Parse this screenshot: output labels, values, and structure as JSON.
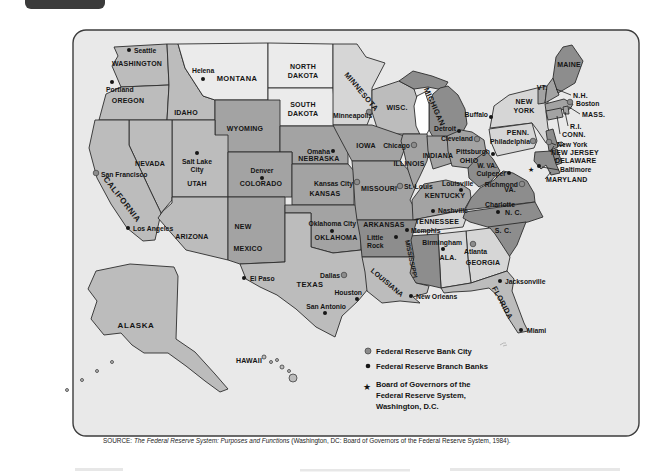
{
  "theme": {
    "panel": "#e9e9e9",
    "panel_border": "#3c3c3c",
    "tab": "#3b3b3b",
    "line": "#2d2d2d",
    "ink": "#141414",
    "lightest": "#ebebeb",
    "light": "#d6d6d6",
    "medium": "#bcbcbc",
    "mediumdark": "#a3a3a3",
    "dark": "#8d8d8d",
    "lake": "#ffffff",
    "dot_bank": "#8c8c8c",
    "dot_branch": "#161616"
  },
  "map": {
    "states": [
      {
        "t": "WASHINGTON"
      },
      {
        "t": "OREGON"
      },
      {
        "t": "IDAHO"
      },
      {
        "t": "MONTANA"
      },
      {
        "t": "NORTH\nDAKOTA"
      },
      {
        "t": "SOUTH\nDAKOTA"
      },
      {
        "t": "WYOMING"
      },
      {
        "t": "NEVADA"
      },
      {
        "t": "UTAH"
      },
      {
        "t": "COLORADO"
      },
      {
        "t": "NEBRASKA"
      },
      {
        "t": "IOWA"
      },
      {
        "t": "KANSAS"
      },
      {
        "t": "MISSOURI"
      },
      {
        "t": "CALIFORNIA"
      },
      {
        "t": "ARIZONA"
      },
      {
        "t": "NEW"
      },
      {
        "t": "MEXICO"
      },
      {
        "t": "OKLAHOMA"
      },
      {
        "t": "ARKANSAS"
      },
      {
        "t": "TEXAS"
      },
      {
        "t": "MINNESOTA"
      },
      {
        "t": "WISC."
      },
      {
        "t": "MICHIGAN"
      },
      {
        "t": "ILLINOIS"
      },
      {
        "t": "INDIANA"
      },
      {
        "t": "OHIO"
      },
      {
        "t": "KENTUCKY"
      },
      {
        "t": "TENNESSEE"
      },
      {
        "t": "MISSISSIPPI"
      },
      {
        "t": "ALA."
      },
      {
        "t": "GEORGIA"
      },
      {
        "t": "LOUISIANA"
      },
      {
        "t": "FLORIDA"
      },
      {
        "t": "NEW\nYORK"
      },
      {
        "t": "PENN."
      },
      {
        "t": "MAINE"
      },
      {
        "t": "VT."
      },
      {
        "t": "W. VA."
      },
      {
        "t": "VA."
      },
      {
        "t": "S. C."
      },
      {
        "t": "N. C."
      },
      {
        "t": "ALASKA"
      },
      {
        "t": "HAWAII"
      }
    ],
    "cities": [
      {
        "n": "Seattle",
        "type": "branch"
      },
      {
        "n": "Portland",
        "type": "branch"
      },
      {
        "n": "Helena",
        "type": "branch"
      },
      {
        "n": "Salt Lake\nCity",
        "type": "branch"
      },
      {
        "n": "San Francisco",
        "type": "bank"
      },
      {
        "n": "Los Angeles",
        "type": "branch"
      },
      {
        "n": "Denver",
        "type": "branch"
      },
      {
        "n": "Omaha",
        "type": "branch"
      },
      {
        "n": "Kansas City",
        "type": "bank"
      },
      {
        "n": "Oklahoma City",
        "type": "branch"
      },
      {
        "n": "Little\nRock",
        "type": "branch"
      },
      {
        "n": "Dallas",
        "type": "bank"
      },
      {
        "n": "El Paso",
        "type": "branch"
      },
      {
        "n": "Houston",
        "type": "branch"
      },
      {
        "n": "San Antonio",
        "type": "branch"
      },
      {
        "n": "New Orleans",
        "type": "branch"
      },
      {
        "n": "Memphis",
        "type": "branch"
      },
      {
        "n": "Nashville",
        "type": "branch"
      },
      {
        "n": "Birmingham",
        "type": "branch"
      },
      {
        "n": "Atlanta",
        "type": "bank"
      },
      {
        "n": "Jacksonville",
        "type": "branch"
      },
      {
        "n": "Miami",
        "type": "branch"
      },
      {
        "n": "Minneapolis",
        "type": "bank"
      },
      {
        "n": "Chicago",
        "type": "bank"
      },
      {
        "n": "St. Louis",
        "type": "bank"
      },
      {
        "n": "Detroit",
        "type": "branch"
      },
      {
        "n": "Cleveland",
        "type": "bank"
      },
      {
        "n": "Buffalo",
        "type": "branch"
      },
      {
        "n": "Pittsburgh",
        "type": "branch"
      },
      {
        "n": "Louisville",
        "type": "branch"
      },
      {
        "n": "Philadelphia",
        "type": "bank"
      },
      {
        "n": "Culpeper",
        "type": "branch"
      },
      {
        "n": "Richmond",
        "type": "bank"
      },
      {
        "n": "Charlotte",
        "type": "branch"
      },
      {
        "n": "Boston",
        "type": "bank"
      },
      {
        "n": "New York",
        "type": "bank"
      },
      {
        "n": "Baltimore",
        "type": "branch"
      }
    ],
    "outside_labels": [
      {
        "t": "N.H."
      },
      {
        "t": "MASS."
      },
      {
        "t": "R.I."
      },
      {
        "t": "CONN."
      },
      {
        "t": "NEW JERSEY"
      },
      {
        "t": "DELAWARE"
      },
      {
        "t": "MARYLAND"
      }
    ],
    "legend": {
      "items": [
        {
          "symbol": "bank-dot",
          "label": "Federal Reserve Bank City"
        },
        {
          "symbol": "branch-dot",
          "label": "Federal Reserve Branch Banks"
        },
        {
          "symbol": "star",
          "label": "Board of Governors of the\nFederal Reserve System,\nWashington, D.C."
        }
      ],
      "star_glyph": "★"
    },
    "board_star_glyph": "★",
    "source": {
      "prefix": "SOURCE: ",
      "title": "The Federal Reserve System: Purposes and Functions",
      "rest": " (Washington, DC: Board of Governors of the Federal Reserve System, 1984)."
    }
  }
}
